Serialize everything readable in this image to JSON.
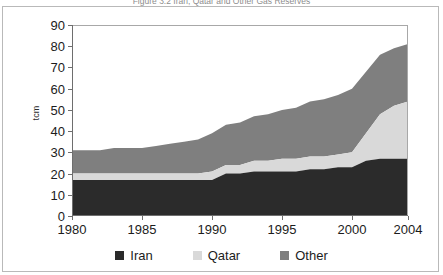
{
  "figure": {
    "title_clipped": "Figure 3.2 Iran, Qatar and Other Gas Reserves",
    "y_axis_title": "tcm"
  },
  "colors": {
    "iran": "#2b2b2b",
    "qatar": "#d9d9d9",
    "other": "#7f7f7f",
    "axis": "#6e6e6e",
    "frame": "#b9b9b9",
    "text": "#1c1c1c"
  },
  "legend": {
    "position": "bottom-center",
    "items": [
      {
        "label": "Iran",
        "color": "#2b2b2b"
      },
      {
        "label": "Qatar",
        "color": "#d9d9d9"
      },
      {
        "label": "Other",
        "color": "#7f7f7f"
      }
    ]
  },
  "chart_data": {
    "type": "area",
    "stacked": true,
    "title": "Figure 3.2 Iran, Qatar and Other Gas Reserves",
    "xlabel": "",
    "ylabel": "tcm",
    "ylim": [
      0,
      90
    ],
    "ytick_values": [
      0,
      10,
      20,
      30,
      40,
      50,
      60,
      70,
      80,
      90
    ],
    "xlim": [
      1980,
      2004
    ],
    "xtick_values": [
      1980,
      1985,
      1990,
      1995,
      2000,
      2004
    ],
    "grid": false,
    "x": [
      1980,
      1981,
      1982,
      1983,
      1984,
      1985,
      1986,
      1987,
      1988,
      1989,
      1990,
      1991,
      1992,
      1993,
      1994,
      1995,
      1996,
      1997,
      1998,
      1999,
      2000,
      2001,
      2002,
      2003,
      2004
    ],
    "series": [
      {
        "name": "Iran",
        "color": "#2b2b2b",
        "values": [
          17,
          17,
          17,
          17,
          17,
          17,
          17,
          17,
          17,
          17,
          17,
          20,
          20,
          21,
          21,
          21,
          21,
          22,
          22,
          23,
          23,
          26,
          27,
          27,
          27
        ]
      },
      {
        "name": "Qatar",
        "color": "#d9d9d9",
        "values": [
          3,
          3,
          3,
          3,
          3,
          3,
          3,
          3,
          3,
          3,
          4,
          4,
          4,
          5,
          5,
          6,
          6,
          6,
          6,
          6,
          7,
          13,
          21,
          25,
          27
        ]
      },
      {
        "name": "Other",
        "color": "#7f7f7f",
        "values": [
          11,
          11,
          11,
          12,
          12,
          12,
          13,
          14,
          15,
          16,
          18,
          19,
          20,
          21,
          22,
          23,
          24,
          26,
          27,
          28,
          30,
          29,
          28,
          27,
          27
        ]
      }
    ],
    "totals": [
      31,
      31,
      31,
      32,
      32,
      32,
      33,
      34,
      35,
      36,
      39,
      43,
      44,
      47,
      48,
      50,
      51,
      54,
      55,
      57,
      60,
      68,
      76,
      79,
      81
    ]
  }
}
